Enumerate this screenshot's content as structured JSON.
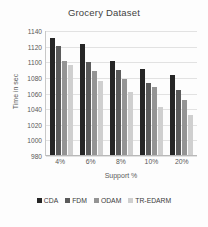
{
  "chart_data": {
    "type": "bar",
    "title": "Grocery Dataset",
    "xlabel": "Support %",
    "ylabel": "Time in sec",
    "categories": [
      "4%",
      "6%",
      "8%",
      "10%",
      "20%"
    ],
    "series": [
      {
        "name": "CDA",
        "color": "#262626",
        "values": [
          1131,
          1124,
          1101,
          1092,
          1084
        ]
      },
      {
        "name": "FDM",
        "color": "#5b5b5b",
        "values": [
          1121,
          1100,
          1090,
          1073,
          1064
        ]
      },
      {
        "name": "ODAM",
        "color": "#949494",
        "values": [
          1101,
          1089,
          1079,
          1068,
          1052
        ]
      },
      {
        "name": "TR-EDARM",
        "color": "#cfcfcf",
        "values": [
          1097,
          1076,
          1062,
          1043,
          1033
        ]
      }
    ],
    "ylim": [
      980,
      1140
    ],
    "ytick_values": [
      1140,
      1120,
      1100,
      1080,
      1060,
      1040,
      1020,
      1000,
      980
    ],
    "ytick_labels": [
      "1140",
      "1120",
      "1100",
      "1080",
      "1060",
      "1040",
      "1020",
      "1000",
      "980"
    ],
    "grid": true,
    "legend_position": "bottom"
  }
}
